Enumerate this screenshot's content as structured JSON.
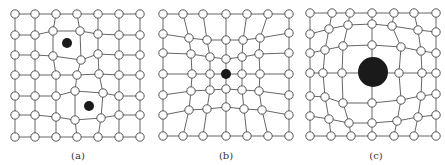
{
  "colors": {
    "edge": "#555555",
    "node_fill": "#ffffff",
    "node_stroke": "#444444",
    "defect": "#1a1a1a"
  },
  "node_radius": 4.2,
  "panels": [
    {
      "id": "a",
      "caption": "(a)",
      "caption_pos": [
        78,
        152
      ],
      "description": "Square lattice with two interstitial/vacancy point defects; neighboring nodes slightly displaced",
      "nodes": [
        [
          [
            15,
            14
          ],
          [
            35,
            14
          ],
          [
            56,
            14
          ],
          [
            77,
            14
          ],
          [
            98,
            14
          ],
          [
            119,
            14
          ],
          [
            140,
            14
          ]
        ],
        [
          [
            15,
            35
          ],
          [
            35,
            35
          ],
          [
            53,
            31
          ],
          [
            80,
            31
          ],
          [
            98,
            34
          ],
          [
            119,
            35
          ],
          [
            140,
            35
          ]
        ],
        [
          [
            15,
            55
          ],
          [
            35,
            55
          ],
          [
            53,
            56
          ],
          [
            81,
            60
          ],
          [
            98,
            54
          ],
          [
            119,
            55
          ],
          [
            140,
            55
          ]
        ],
        [
          [
            15,
            75
          ],
          [
            35,
            75
          ],
          [
            56,
            75
          ],
          [
            77,
            75
          ],
          [
            99,
            74
          ],
          [
            119,
            75
          ],
          [
            140,
            75
          ]
        ],
        [
          [
            15,
            96
          ],
          [
            35,
            96
          ],
          [
            56,
            96
          ],
          [
            75,
            91
          ],
          [
            103,
            93
          ],
          [
            119,
            96
          ],
          [
            140,
            96
          ]
        ],
        [
          [
            15,
            115
          ],
          [
            35,
            115
          ],
          [
            56,
            117
          ],
          [
            75,
            120
          ],
          [
            101,
            118
          ],
          [
            119,
            115
          ],
          [
            140,
            115
          ]
        ],
        [
          [
            15,
            137
          ],
          [
            35,
            137
          ],
          [
            56,
            137
          ],
          [
            77,
            137
          ],
          [
            98,
            137
          ],
          [
            119,
            137
          ],
          [
            140,
            137
          ]
        ]
      ],
      "defects": [
        {
          "cx": 67,
          "cy": 43,
          "r": 5
        },
        {
          "cx": 89,
          "cy": 106,
          "r": 5
        }
      ],
      "removed": []
    },
    {
      "id": "b",
      "caption": "(b)",
      "caption_pos": [
        226,
        152
      ],
      "description": "Lattice contracted toward a small substitutional atom at center",
      "nodes": [
        [
          [
            163,
            14
          ],
          [
            183,
            14
          ],
          [
            203,
            14
          ],
          [
            226,
            14
          ],
          [
            247,
            14
          ],
          [
            268,
            14
          ],
          [
            289,
            14
          ]
        ],
        [
          [
            163,
            34
          ],
          [
            189,
            38
          ],
          [
            207,
            40
          ],
          [
            226,
            40
          ],
          [
            243,
            40
          ],
          [
            260,
            38
          ],
          [
            289,
            33
          ]
        ],
        [
          [
            163,
            53
          ],
          [
            191,
            54
          ],
          [
            210,
            57
          ],
          [
            226,
            59
          ],
          [
            242,
            57
          ],
          [
            259,
            54
          ],
          [
            289,
            53
          ]
        ],
        [
          [
            163,
            74
          ],
          [
            192,
            74
          ],
          [
            210,
            74
          ],
          [
            226,
            74
          ],
          [
            242,
            74
          ],
          [
            260,
            74
          ],
          [
            289,
            74
          ]
        ],
        [
          [
            163,
            95
          ],
          [
            191,
            91
          ],
          [
            210,
            90
          ],
          [
            226,
            89
          ],
          [
            242,
            90
          ],
          [
            259,
            91
          ],
          [
            289,
            95
          ]
        ],
        [
          [
            163,
            115
          ],
          [
            189,
            110
          ],
          [
            207,
            109
          ],
          [
            226,
            107
          ],
          [
            244,
            109
          ],
          [
            262,
            110
          ],
          [
            289,
            115
          ]
        ],
        [
          [
            163,
            136
          ],
          [
            183,
            136
          ],
          [
            203,
            136
          ],
          [
            226,
            136
          ],
          [
            247,
            136
          ],
          [
            268,
            136
          ],
          [
            289,
            136
          ]
        ]
      ],
      "defects": [
        {
          "cx": 226,
          "cy": 74,
          "r": 5
        }
      ],
      "removed": [
        [
          3,
          3
        ]
      ]
    },
    {
      "id": "c",
      "caption": "(c)",
      "caption_pos": [
        376,
        152
      ],
      "description": "Lattice expanded outward around a large substitutional atom at center",
      "nodes": [
        [
          [
            310,
            13
          ],
          [
            332,
            13
          ],
          [
            350,
            13
          ],
          [
            372,
            13
          ],
          [
            394,
            13
          ],
          [
            414,
            13
          ],
          [
            436,
            13
          ]
        ],
        [
          [
            310,
            34
          ],
          [
            329,
            29
          ],
          [
            348,
            25
          ],
          [
            372,
            24
          ],
          [
            392,
            26
          ],
          [
            418,
            30
          ],
          [
            436,
            32
          ]
        ],
        [
          [
            310,
            53
          ],
          [
            325,
            50
          ],
          [
            343,
            46
          ],
          [
            372,
            45
          ],
          [
            401,
            47
          ],
          [
            421,
            51
          ],
          [
            436,
            53
          ]
        ],
        [
          [
            310,
            73
          ],
          [
            323,
            73
          ],
          [
            342,
            73
          ],
          [
            372,
            73
          ],
          [
            399,
            73
          ],
          [
            422,
            73
          ],
          [
            436,
            73
          ]
        ],
        [
          [
            310,
            96
          ],
          [
            325,
            97
          ],
          [
            343,
            103
          ],
          [
            372,
            103
          ],
          [
            401,
            100
          ],
          [
            421,
            96
          ],
          [
            436,
            94
          ]
        ],
        [
          [
            310,
            116
          ],
          [
            329,
            119
          ],
          [
            349,
            123
          ],
          [
            372,
            123
          ],
          [
            397,
            121
          ],
          [
            418,
            117
          ],
          [
            436,
            115
          ]
        ],
        [
          [
            310,
            136
          ],
          [
            331,
            136
          ],
          [
            351,
            136
          ],
          [
            372,
            136
          ],
          [
            394,
            136
          ],
          [
            414,
            136
          ],
          [
            436,
            136
          ]
        ]
      ],
      "defects": [
        {
          "cx": 373,
          "cy": 72,
          "r": 15
        }
      ],
      "removed": [
        [
          3,
          3
        ]
      ]
    }
  ]
}
